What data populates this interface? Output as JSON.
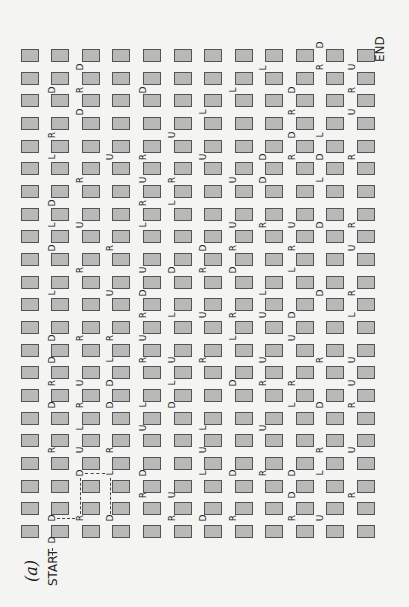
{
  "figure_label": "(a)",
  "start_label": "START",
  "end_label": "END",
  "grid": {
    "columns": 12,
    "rows": 22,
    "col_x": [
      21,
      51,
      82,
      112,
      143,
      174,
      204,
      235,
      265,
      296,
      326,
      357
    ],
    "row_y": [
      49,
      72,
      94,
      117,
      140,
      162,
      185,
      208,
      230,
      253,
      276,
      298,
      321,
      344,
      366,
      389,
      412,
      434,
      457,
      480,
      502,
      525
    ]
  },
  "letters": [
    {
      "t": "D",
      "x": 80,
      "y": 67
    },
    {
      "t": "D",
      "x": 52,
      "y": 90
    },
    {
      "t": "R",
      "x": 80,
      "y": 90
    },
    {
      "t": "D",
      "x": 80,
      "y": 112
    },
    {
      "t": "R",
      "x": 52,
      "y": 135
    },
    {
      "t": "L",
      "x": 52,
      "y": 157
    },
    {
      "t": "U",
      "x": 110,
      "y": 157
    },
    {
      "t": "R",
      "x": 80,
      "y": 180
    },
    {
      "t": "D",
      "x": 52,
      "y": 203
    },
    {
      "t": "L",
      "x": 52,
      "y": 225
    },
    {
      "t": "U",
      "x": 80,
      "y": 225
    },
    {
      "t": "D",
      "x": 52,
      "y": 248
    },
    {
      "t": "R",
      "x": 110,
      "y": 248
    },
    {
      "t": "R",
      "x": 80,
      "y": 270
    },
    {
      "t": "L",
      "x": 52,
      "y": 293
    },
    {
      "t": "U",
      "x": 110,
      "y": 293
    },
    {
      "t": "D",
      "x": 52,
      "y": 338
    },
    {
      "t": "R",
      "x": 80,
      "y": 338
    },
    {
      "t": "R",
      "x": 110,
      "y": 338
    },
    {
      "t": "D",
      "x": 52,
      "y": 360
    },
    {
      "t": "L",
      "x": 110,
      "y": 360
    },
    {
      "t": "R",
      "x": 52,
      "y": 383
    },
    {
      "t": "U",
      "x": 80,
      "y": 383
    },
    {
      "t": "D",
      "x": 110,
      "y": 383
    },
    {
      "t": "D",
      "x": 52,
      "y": 405
    },
    {
      "t": "R",
      "x": 80,
      "y": 405
    },
    {
      "t": "D",
      "x": 110,
      "y": 405
    },
    {
      "t": "L",
      "x": 80,
      "y": 428
    },
    {
      "t": "R",
      "x": 52,
      "y": 450
    },
    {
      "t": "U",
      "x": 80,
      "y": 450
    },
    {
      "t": "R",
      "x": 110,
      "y": 450
    },
    {
      "t": "D",
      "x": 80,
      "y": 473
    },
    {
      "t": "L",
      "x": 110,
      "y": 473
    },
    {
      "t": "D",
      "x": 52,
      "y": 518
    },
    {
      "t": "R",
      "x": 80,
      "y": 518
    },
    {
      "t": "D",
      "x": 110,
      "y": 518
    },
    {
      "t": "D",
      "x": 143,
      "y": 90
    },
    {
      "t": "L",
      "x": 263,
      "y": 68
    },
    {
      "t": "L",
      "x": 233,
      "y": 90
    },
    {
      "t": "L",
      "x": 203,
      "y": 112
    },
    {
      "t": "U",
      "x": 172,
      "y": 135
    },
    {
      "t": "R",
      "x": 143,
      "y": 157
    },
    {
      "t": "U",
      "x": 203,
      "y": 157
    },
    {
      "t": "D",
      "x": 263,
      "y": 157
    },
    {
      "t": "U",
      "x": 143,
      "y": 180
    },
    {
      "t": "R",
      "x": 172,
      "y": 180
    },
    {
      "t": "U",
      "x": 233,
      "y": 180
    },
    {
      "t": "D",
      "x": 263,
      "y": 180
    },
    {
      "t": "R",
      "x": 143,
      "y": 203
    },
    {
      "t": "L",
      "x": 172,
      "y": 203
    },
    {
      "t": "U",
      "x": 233,
      "y": 225
    },
    {
      "t": "R",
      "x": 263,
      "y": 225
    },
    {
      "t": "L",
      "x": 143,
      "y": 225
    },
    {
      "t": "D",
      "x": 203,
      "y": 248
    },
    {
      "t": "R",
      "x": 233,
      "y": 248
    },
    {
      "t": "U",
      "x": 143,
      "y": 270
    },
    {
      "t": "D",
      "x": 172,
      "y": 270
    },
    {
      "t": "R",
      "x": 203,
      "y": 270
    },
    {
      "t": "D",
      "x": 233,
      "y": 270
    },
    {
      "t": "D",
      "x": 143,
      "y": 293
    },
    {
      "t": "L",
      "x": 263,
      "y": 293
    },
    {
      "t": "R",
      "x": 143,
      "y": 315
    },
    {
      "t": "L",
      "x": 172,
      "y": 315
    },
    {
      "t": "U",
      "x": 203,
      "y": 315
    },
    {
      "t": "R",
      "x": 233,
      "y": 315
    },
    {
      "t": "U",
      "x": 263,
      "y": 315
    },
    {
      "t": "U",
      "x": 143,
      "y": 338
    },
    {
      "t": "L",
      "x": 233,
      "y": 338
    },
    {
      "t": "R",
      "x": 143,
      "y": 360
    },
    {
      "t": "U",
      "x": 172,
      "y": 360
    },
    {
      "t": "R",
      "x": 203,
      "y": 360
    },
    {
      "t": "U",
      "x": 263,
      "y": 360
    },
    {
      "t": "L",
      "x": 172,
      "y": 383
    },
    {
      "t": "D",
      "x": 233,
      "y": 383
    },
    {
      "t": "R",
      "x": 263,
      "y": 383
    },
    {
      "t": "D",
      "x": 172,
      "y": 405
    },
    {
      "t": "L",
      "x": 143,
      "y": 405
    },
    {
      "t": "U",
      "x": 143,
      "y": 428
    },
    {
      "t": "L",
      "x": 203,
      "y": 428
    },
    {
      "t": "U",
      "x": 263,
      "y": 428
    },
    {
      "t": "U",
      "x": 203,
      "y": 450
    },
    {
      "t": "D",
      "x": 143,
      "y": 473
    },
    {
      "t": "L",
      "x": 203,
      "y": 473
    },
    {
      "t": "D",
      "x": 233,
      "y": 473
    },
    {
      "t": "R",
      "x": 263,
      "y": 473
    },
    {
      "t": "R",
      "x": 143,
      "y": 495
    },
    {
      "t": "U",
      "x": 172,
      "y": 495
    },
    {
      "t": "R",
      "x": 172,
      "y": 518
    },
    {
      "t": "D",
      "x": 203,
      "y": 518
    },
    {
      "t": "R",
      "x": 233,
      "y": 518
    },
    {
      "t": "D",
      "x": 320,
      "y": 45
    },
    {
      "t": "R",
      "x": 320,
      "y": 67
    },
    {
      "t": "U",
      "x": 352,
      "y": 67
    },
    {
      "t": "D",
      "x": 292,
      "y": 90
    },
    {
      "t": "R",
      "x": 352,
      "y": 90
    },
    {
      "t": "R",
      "x": 292,
      "y": 112
    },
    {
      "t": "U",
      "x": 352,
      "y": 112
    },
    {
      "t": "D",
      "x": 292,
      "y": 135
    },
    {
      "t": "L",
      "x": 320,
      "y": 135
    },
    {
      "t": "R",
      "x": 292,
      "y": 157
    },
    {
      "t": "D",
      "x": 320,
      "y": 157
    },
    {
      "t": "R",
      "x": 352,
      "y": 157
    },
    {
      "t": "L",
      "x": 320,
      "y": 180
    },
    {
      "t": "U",
      "x": 292,
      "y": 225
    },
    {
      "t": "D",
      "x": 320,
      "y": 225
    },
    {
      "t": "R",
      "x": 352,
      "y": 225
    },
    {
      "t": "R",
      "x": 292,
      "y": 248
    },
    {
      "t": "U",
      "x": 352,
      "y": 248
    },
    {
      "t": "L",
      "x": 292,
      "y": 270
    },
    {
      "t": "D",
      "x": 320,
      "y": 293
    },
    {
      "t": "R",
      "x": 352,
      "y": 293
    },
    {
      "t": "D",
      "x": 292,
      "y": 315
    },
    {
      "t": "L",
      "x": 352,
      "y": 315
    },
    {
      "t": "U",
      "x": 292,
      "y": 338
    },
    {
      "t": "R",
      "x": 320,
      "y": 360
    },
    {
      "t": "U",
      "x": 352,
      "y": 360
    },
    {
      "t": "R",
      "x": 292,
      "y": 383
    },
    {
      "t": "U",
      "x": 352,
      "y": 383
    },
    {
      "t": "L",
      "x": 292,
      "y": 405
    },
    {
      "t": "D",
      "x": 320,
      "y": 405
    },
    {
      "t": "R",
      "x": 352,
      "y": 405
    },
    {
      "t": "R",
      "x": 320,
      "y": 450
    },
    {
      "t": "U",
      "x": 352,
      "y": 450
    },
    {
      "t": "D",
      "x": 292,
      "y": 473
    },
    {
      "t": "L",
      "x": 320,
      "y": 473
    },
    {
      "t": "D",
      "x": 292,
      "y": 495
    },
    {
      "t": "R",
      "x": 352,
      "y": 495
    },
    {
      "t": "R",
      "x": 292,
      "y": 518
    },
    {
      "t": "U",
      "x": 320,
      "y": 518
    },
    {
      "t": "D",
      "x": 52,
      "y": 540
    }
  ]
}
